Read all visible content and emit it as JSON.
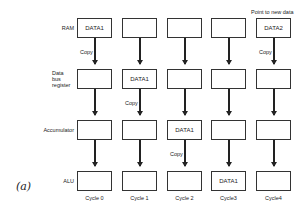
{
  "diagram": {
    "row_labels": [
      "RAM",
      "Data bus register",
      "Accumulator",
      "ALU"
    ],
    "row_label_lines": {
      "dbr": [
        "Data",
        "bus",
        "register"
      ]
    },
    "cycles": [
      "Cycle 0",
      "Cycle 1",
      "Cycle 2",
      "Cycle3",
      "Cycle4"
    ],
    "cells": {
      "ram": [
        "DATA1",
        "",
        "",
        "",
        "DATA2"
      ],
      "dbr": [
        "",
        "DATA1",
        "",
        "",
        ""
      ],
      "acc": [
        "",
        "",
        "DATA1",
        "",
        ""
      ],
      "alu": [
        "",
        "",
        "",
        "DATA1",
        ""
      ]
    },
    "copy_label": "Copy",
    "copy_annotations": [
      {
        "column": 0,
        "between": "RAM-DBR"
      },
      {
        "column": 1,
        "between": "DBR-ACC"
      },
      {
        "column": 2,
        "between": "ACC-ALU"
      },
      {
        "column": 4,
        "between": "RAM-DBR"
      }
    ],
    "note": "Point to new data",
    "figure_label": "(a)"
  }
}
